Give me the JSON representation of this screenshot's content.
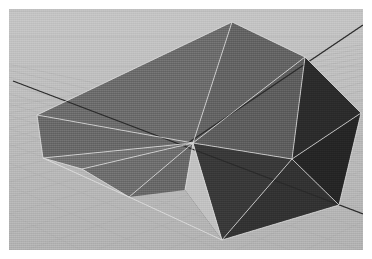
{
  "app": {
    "title": "3D Viewport",
    "render_mode": "shaded-wireframe",
    "projection": "perspective"
  },
  "canvas": {
    "width": 372,
    "height": 259,
    "margin": 9,
    "viewport_width": 354,
    "viewport_height": 241
  },
  "colors": {
    "page_background": "#ffffff",
    "ground_base": "#bcbcbc",
    "ground_far": "#c4c4c4",
    "ground_near": "#b2b2b2",
    "grid_line": "#a8a8a8",
    "axis_line": "#2b2b2b",
    "wireframe": "#e6e6e6",
    "face_top_light": "#6e6e6e",
    "face_top_mid": "#676767",
    "face_left_wing": "#757575",
    "face_left_wing_dark": "#6a6a6a",
    "face_right_dark": "#2e2e2e",
    "face_right_darker": "#262626",
    "face_lower_dark": "#343434",
    "gap_highlight": "#c9c9c9"
  },
  "ground": {
    "type": "perspective-grid",
    "horizontal_lines": 9,
    "diagonal_lines_left": 10,
    "diagonal_lines_right": 10,
    "grid_opacity": 0.35
  },
  "axes": [
    {
      "name": "axis-primary",
      "x1": 4,
      "y1": 72,
      "x2": 354,
      "y2": 205,
      "color": "#2b2b2b",
      "width": 1.3
    },
    {
      "name": "axis-secondary",
      "x1": 354,
      "y1": 16,
      "x2": 176,
      "y2": 136,
      "color": "#2b2b2b",
      "width": 1.3
    }
  ],
  "model": {
    "name": "folded-polygon-surface",
    "face_count": 12,
    "vertex_hub": {
      "x": 184,
      "y": 134
    },
    "faces": [
      {
        "name": "face-top-left-upper",
        "points": "223,13 184,134 28,106",
        "fill": "#6e6e6e"
      },
      {
        "name": "face-top-left-lower",
        "points": "28,106 184,134 34,149",
        "fill": "#6b6b6b"
      },
      {
        "name": "face-top-center",
        "points": "223,13 296,48 184,134",
        "fill": "#656565"
      },
      {
        "name": "face-top-right-fold",
        "points": "296,48 283,150 184,134",
        "fill": "#5f5f5f"
      },
      {
        "name": "face-right-dark-main",
        "points": "296,48 352,104 283,150",
        "fill": "#2c2c2c"
      },
      {
        "name": "face-right-dark-low",
        "points": "352,104 330,196 283,150",
        "fill": "#262626"
      },
      {
        "name": "face-lower-spike",
        "points": "283,150 330,196 213,231",
        "fill": "#333333"
      },
      {
        "name": "face-lower-spike-in",
        "points": "283,150 213,231 184,134",
        "fill": "#3a3a3a"
      },
      {
        "name": "wing-left-upper",
        "points": "184,134 34,149 73,160",
        "fill": "#757575"
      },
      {
        "name": "wing-left-mid",
        "points": "184,134 73,160 120,188",
        "fill": "#707070"
      },
      {
        "name": "wing-left-lower",
        "points": "184,134 120,188 176,181",
        "fill": "#6a6a6a"
      },
      {
        "name": "wing-left-tail",
        "points": "184,134 176,181 213,231",
        "fill": "#636363"
      }
    ],
    "gap_triangle": {
      "name": "background-gap",
      "points": "184,134 213,231 176,181",
      "fill": "#c2c2c2"
    },
    "wireframe_edges": [
      "223,13 296,48",
      "296,48 352,104",
      "352,104 330,196",
      "330,196 213,231",
      "213,231 120,188",
      "120,188 34,149",
      "34,149 28,106",
      "28,106 223,13",
      "223,13 184,134",
      "296,48 184,134",
      "352,104 283,150",
      "283,150 184,134",
      "283,150 296,48",
      "283,150 330,196",
      "283,150 213,231",
      "184,134 28,106",
      "184,134 34,149",
      "184,134 73,160",
      "184,134 120,188",
      "184,134 176,181",
      "184,134 213,231",
      "34,149 73,160",
      "73,160 120,188"
    ]
  }
}
